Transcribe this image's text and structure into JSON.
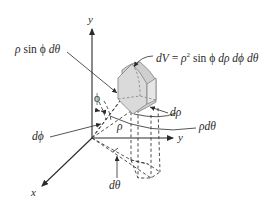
{
  "figure": {
    "colors": {
      "ink": "#2a2a2a",
      "box_fill": "#cfcfcf",
      "box_face_light": "#e2e2e2",
      "box_stroke": "#8a8a8a",
      "background": "#ffffff"
    },
    "axes": {
      "vertical_label": "y",
      "horizontal_label": "y",
      "diagonal_label": "x"
    },
    "labels": {
      "volume_element": "dV = ρ² sin ϕ dρ dϕ dθ",
      "volume_element_parts": {
        "lhs": "dV",
        "eq": " = ",
        "rho": "ρ",
        "sq": "2",
        "sin": " sin ",
        "phi": "ϕ",
        "tail": " dρ dϕ dθ"
      },
      "arc_theta_side": "ρ sin ϕ dθ",
      "arc_theta_side_parts": {
        "rho": "ρ",
        "sin": " sin ",
        "phi": "ϕ",
        "tail": " dθ"
      },
      "phi": "ϕ",
      "d_phi": "dϕ",
      "rho": "ρ",
      "d_rho": "dρ",
      "rho_d_phi": "ρdθ",
      "d_theta": "dθ"
    }
  }
}
